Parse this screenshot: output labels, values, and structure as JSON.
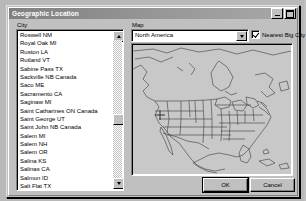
{
  "window": {
    "title": "Geographic Location",
    "titlebar_buttons": [
      {
        "name": "minimize-button",
        "glyph": "_"
      },
      {
        "name": "maximize-button",
        "glyph": "□"
      }
    ]
  },
  "city_panel": {
    "label": "City",
    "selected": "San Francisco CA",
    "items": [
      "Roswell NM",
      "Royal Oak MI",
      "Ruston LA",
      "Rutland VT",
      "Sabine Pass TX",
      "Sackville NB Canada",
      "Saco ME",
      "Sacramento CA",
      "Saginaw MI",
      "Saint Catharines ON Canada",
      "Saint George UT",
      "Saint John NB Canada",
      "Salem MI",
      "Salem NH",
      "Salem OR",
      "Salina KS",
      "Salinas CA",
      "Salmon ID",
      "Salt Flat TX",
      "Salt Lake City UT",
      "Sandwich IL",
      "San Angelo TX",
      "San Antonio TX",
      "San Bernardino CA",
      "San Diego CA",
      "San Francisco CA",
      "San Jose CA"
    ]
  },
  "map_panel": {
    "label": "Map",
    "region_selected": "North America",
    "region_options": [
      "North America"
    ],
    "nearest_big_city": {
      "label": "Nearest Big City",
      "checked": true
    },
    "marker_city": "San Francisco CA"
  },
  "footer": {
    "ok_label": "OK",
    "cancel_label": "Cancel"
  },
  "colors": {
    "selection": "#000080",
    "face": "#c0c0c0",
    "field": "#ffffff",
    "titlebar": "#808080"
  }
}
